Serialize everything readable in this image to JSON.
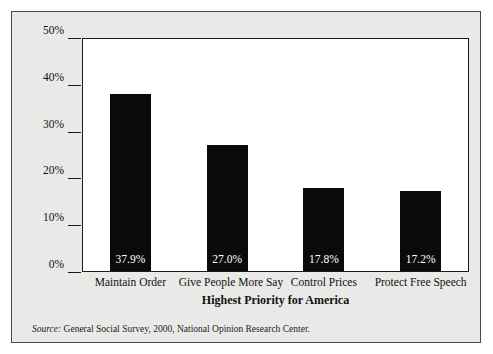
{
  "chart_data": {
    "type": "bar",
    "title": "",
    "xlabel": "Highest Priority for America",
    "ylabel": "",
    "categories": [
      "Maintain Order",
      "Give People More Say",
      "Control Prices",
      "Protect Free Speech"
    ],
    "values": [
      37.9,
      27.0,
      17.8,
      17.2
    ],
    "data_labels": [
      "37.9%",
      "27.0%",
      "17.8%",
      "17.2%"
    ],
    "ylim": [
      0,
      50
    ],
    "ytick_values": [
      0,
      10,
      20,
      30,
      40,
      50
    ],
    "ytick_labels": [
      "0%",
      "10%",
      "20%",
      "30%",
      "40%",
      "50%"
    ],
    "grid": false,
    "legend": null,
    "bar_color": "#0a0a0a",
    "plot_background": "#ffffff",
    "figure_background": "#e9e9e7"
  },
  "source": {
    "label": "Source:",
    "text": "General Social Survey, 2000, National Opinion Research Center."
  }
}
